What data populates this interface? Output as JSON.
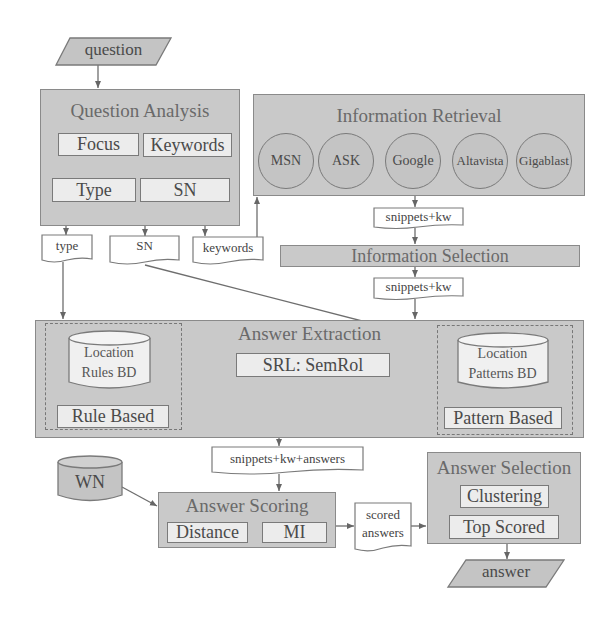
{
  "diagram": {
    "input": {
      "label": "question"
    },
    "output": {
      "label": "answer"
    },
    "question_analysis": {
      "title": "Question Analysis",
      "items": [
        "Focus",
        "Keywords",
        "Type",
        "SN"
      ]
    },
    "outputs_qa": {
      "type": "type",
      "sn": "SN",
      "keywords": "keywords"
    },
    "information_retrieval": {
      "title": "Information Retrieval",
      "engines": [
        "MSN",
        "ASK",
        "Google",
        "Altavista",
        "Gigablast"
      ]
    },
    "snippets_kw_1": "snippets+kw",
    "information_selection": {
      "title": "Information Selection"
    },
    "snippets_kw_2": "snippets+kw",
    "answer_extraction": {
      "title": "Answer Extraction",
      "srl": "SRL: SemRol",
      "rules_db": [
        "Location",
        "Rules BD"
      ],
      "rule_based": "Rule Based",
      "patterns_db": [
        "Location",
        "Patterns BD"
      ],
      "pattern_based": "Pattern Based"
    },
    "snippets_kw_answers": "snippets+kw+answers",
    "wn": {
      "label": "WN"
    },
    "answer_scoring": {
      "title": "Answer Scoring",
      "items": [
        "Distance",
        "MI"
      ]
    },
    "scored_answers": [
      "scored",
      "answers"
    ],
    "answer_selection": {
      "title": "Answer Selection",
      "items": [
        "Clustering",
        "Top Scored"
      ]
    }
  },
  "colors": {
    "panel_fill": "#c9c9c9",
    "inner_fill": "#ececec",
    "stroke": "#7a7a7a",
    "text": "#4a4a4a"
  }
}
